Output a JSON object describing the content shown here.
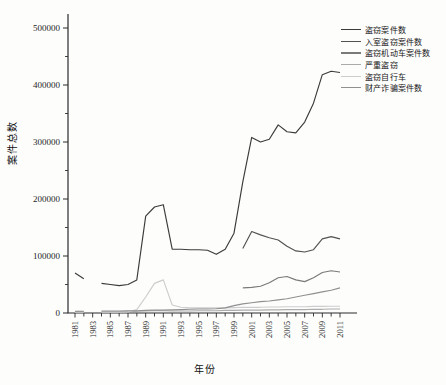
{
  "figure": {
    "background": "#fdfdfc",
    "axis_color": "#2b2b2b",
    "text_color": "#1f1f1f"
  },
  "chart_data": {
    "type": "line",
    "title": "",
    "xlabel": "年份",
    "ylabel": "案件总数",
    "xlim": [
      1980,
      2012
    ],
    "ylim": [
      0,
      520000
    ],
    "grid": false,
    "legend_position": "upper right",
    "x": [
      1981,
      1982,
      1983,
      1984,
      1985,
      1986,
      1987,
      1988,
      1989,
      1990,
      1991,
      1992,
      1993,
      1994,
      1995,
      1996,
      1997,
      1998,
      1999,
      2000,
      2001,
      2002,
      2003,
      2004,
      2005,
      2006,
      2007,
      2008,
      2009,
      2010,
      2011
    ],
    "x_tick_labels": [
      "1981",
      "1983",
      "1985",
      "1987",
      "1989",
      "1991",
      "1993",
      "1995",
      "1997",
      "1999",
      "2001",
      "2003",
      "2005",
      "2007",
      "2009",
      "2011"
    ],
    "y_ticks": [
      0,
      100000,
      200000,
      300000,
      400000,
      500000
    ],
    "y_minor_ticks": [
      50000,
      150000,
      250000,
      350000,
      450000
    ],
    "series": [
      {
        "name": "盗窃案件数",
        "color": "#3b3b3b",
        "values": [
          70000,
          60000,
          null,
          52000,
          50000,
          48000,
          50000,
          58000,
          170000,
          186000,
          190000,
          112000,
          112000,
          111000,
          111000,
          110000,
          103000,
          112000,
          140000,
          230000,
          308000,
          300000,
          305000,
          330000,
          318000,
          316000,
          335000,
          368000,
          418000,
          424000,
          422000
        ]
      },
      {
        "name": "入室盗窃案件数",
        "color": "#525252",
        "values": [
          null,
          null,
          null,
          null,
          null,
          null,
          null,
          null,
          null,
          null,
          null,
          null,
          null,
          null,
          null,
          null,
          null,
          null,
          null,
          113000,
          143000,
          137000,
          132000,
          128000,
          117000,
          109000,
          107000,
          111000,
          130000,
          134000,
          130000
        ]
      },
      {
        "name": "盗窃机动车案件数",
        "color": "#7a7a7a",
        "values": [
          null,
          null,
          null,
          null,
          null,
          null,
          null,
          null,
          null,
          null,
          null,
          null,
          null,
          null,
          null,
          null,
          null,
          null,
          null,
          44000,
          45000,
          47000,
          53000,
          62000,
          64000,
          58000,
          55000,
          62000,
          71000,
          74000,
          72000
        ]
      },
      {
        "name": "严重盗窃",
        "color": "#ababab",
        "values": [
          2000,
          2000,
          null,
          2500,
          2500,
          2500,
          3000,
          3000,
          3500,
          4000,
          4000,
          3500,
          3500,
          3500,
          4000,
          4000,
          4000,
          4500,
          4500,
          5000,
          5000,
          5000,
          5500,
          5500,
          6000,
          6000,
          6000,
          6500,
          6500,
          7000,
          7000
        ]
      },
      {
        "name": "盗窃自行车",
        "color": "#cdcdcd",
        "values": [
          1500,
          1500,
          null,
          1500,
          1500,
          1500,
          2000,
          6000,
          28000,
          52000,
          58000,
          14000,
          10000,
          9000,
          9000,
          9000,
          9000,
          9000,
          9500,
          10000,
          10000,
          10000,
          10500,
          10500,
          11000,
          11000,
          11000,
          11500,
          11500,
          12000,
          12000
        ]
      },
      {
        "name": "财产诈骗案件数",
        "color": "#909090",
        "values": [
          3000,
          3000,
          null,
          3500,
          3500,
          3500,
          4000,
          4000,
          4500,
          5000,
          5000,
          5500,
          6000,
          6500,
          7000,
          7000,
          7500,
          9000,
          13000,
          16000,
          18000,
          20000,
          21000,
          23000,
          25000,
          28000,
          31000,
          34000,
          37000,
          40000,
          44000
        ]
      }
    ]
  }
}
